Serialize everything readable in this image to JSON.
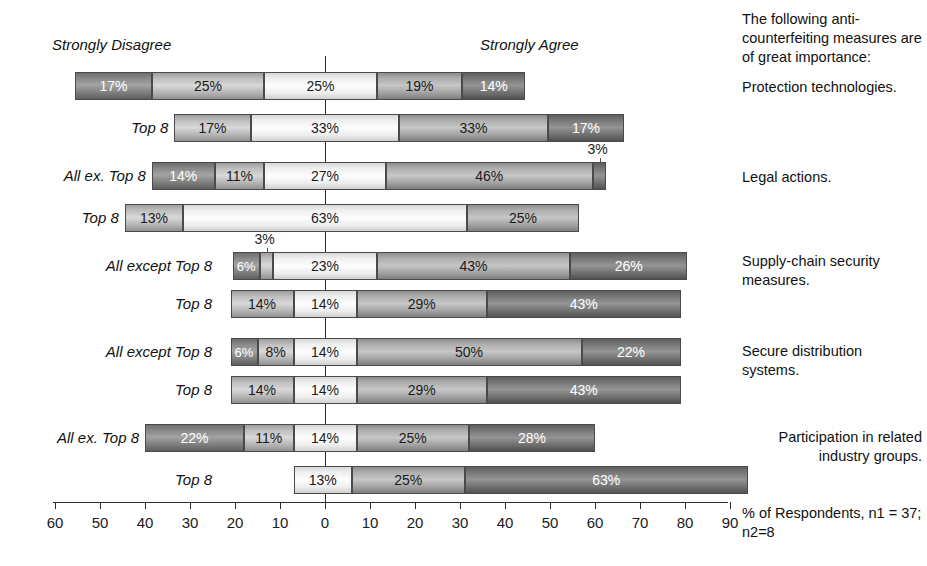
{
  "headers": {
    "left": "Strongly Disagree",
    "right": "Strongly Agree"
  },
  "legend_title": "The following anti-counterfeiting measures are of great importance:",
  "footnote": "% of Respondents, n1 = 37; n2=8",
  "categories": [
    "Protection technologies.",
    "Legal actions.",
    "Supply-chain security measures.",
    "Secure distribution systems.",
    "Participation in related industry groups."
  ],
  "row_labels": [
    "",
    "Top 8",
    "All ex. Top 8",
    "Top 8",
    "All except Top 8",
    "Top 8",
    "All except Top 8",
    "Top 8",
    "All ex. Top 8",
    "Top 8"
  ],
  "axis": {
    "ticks": [
      "60",
      "50",
      "40",
      "30",
      "20",
      "10",
      "0",
      "10",
      "20",
      "30",
      "40",
      "50",
      "60",
      "70",
      "80",
      "90"
    ],
    "min": -60,
    "max": 90,
    "zero": 0
  },
  "chart_data": {
    "type": "bar",
    "subtype": "diverging-stacked-bar",
    "title": "The following anti-counterfeiting measures are of great importance:",
    "xlabel": "% of Respondents, n1 = 37; n2=8",
    "ylabel": "",
    "xlim": [
      -60,
      90
    ],
    "grid": false,
    "legend_position": "none",
    "scale_endpoints": [
      "Strongly Disagree",
      "Strongly Agree"
    ],
    "annotations": [
      "Strongly Disagree",
      "Strongly Agree",
      "n1 = 37; n2=8"
    ],
    "categories": [
      "Protection technologies.",
      "Legal actions.",
      "Supply-chain security measures.",
      "Secure distribution systems.",
      "Participation in related industry groups."
    ],
    "rows": [
      {
        "category": "Protection technologies.",
        "group": "All",
        "label": "",
        "start": -55.5,
        "segments": [
          {
            "level": 1,
            "value": 17,
            "label": "17%"
          },
          {
            "level": 2,
            "value": 25,
            "label": "25%"
          },
          {
            "level": 3,
            "value": 25,
            "label": "25%"
          },
          {
            "level": 4,
            "value": 19,
            "label": "19%"
          },
          {
            "level": 5,
            "value": 14,
            "label": "14%"
          }
        ]
      },
      {
        "category": "Protection technologies.",
        "group": "Top 8",
        "label": "Top 8",
        "start": -33.5,
        "segments": [
          {
            "level": 2,
            "value": 17,
            "label": "17%"
          },
          {
            "level": 3,
            "value": 33,
            "label": "33%"
          },
          {
            "level": 4,
            "value": 33,
            "label": "33%"
          },
          {
            "level": 5,
            "value": 17,
            "label": "17%"
          }
        ]
      },
      {
        "category": "Legal actions.",
        "group": "All ex. Top 8",
        "label": "All ex. Top 8",
        "start": -38.5,
        "segments": [
          {
            "level": 1,
            "value": 14,
            "label": "14%"
          },
          {
            "level": 2,
            "value": 11,
            "label": "11%"
          },
          {
            "level": 3,
            "value": 27,
            "label": "27%"
          },
          {
            "level": 4,
            "value": 46,
            "label": "46%"
          },
          {
            "level": 5,
            "value": 3,
            "label": "3%",
            "callout": true
          }
        ]
      },
      {
        "category": "Legal actions.",
        "group": "Top 8",
        "label": "Top 8",
        "start": -44.5,
        "segments": [
          {
            "level": 2,
            "value": 13,
            "label": "13%"
          },
          {
            "level": 3,
            "value": 63,
            "label": "63%"
          },
          {
            "level": 4,
            "value": 25,
            "label": "25%"
          }
        ]
      },
      {
        "category": "Supply-chain security measures.",
        "group": "All except Top 8",
        "label": "All except Top 8",
        "start": -20.5,
        "segments": [
          {
            "level": 1,
            "value": 6,
            "label": "6%"
          },
          {
            "level": 2,
            "value": 3,
            "label": "3%",
            "callout": true
          },
          {
            "level": 3,
            "value": 23,
            "label": "23%"
          },
          {
            "level": 4,
            "value": 43,
            "label": "43%"
          },
          {
            "level": 5,
            "value": 26,
            "label": "26%"
          }
        ]
      },
      {
        "category": "Supply-chain security measures.",
        "group": "Top 8",
        "label": "Top 8",
        "start": -21.0,
        "segments": [
          {
            "level": 2,
            "value": 14,
            "label": "14%"
          },
          {
            "level": 3,
            "value": 14,
            "label": "14%"
          },
          {
            "level": 4,
            "value": 29,
            "label": "29%"
          },
          {
            "level": 5,
            "value": 43,
            "label": "43%"
          }
        ]
      },
      {
        "category": "Secure distribution systems.",
        "group": "All except Top 8",
        "label": "All except Top 8",
        "start": -21.0,
        "segments": [
          {
            "level": 1,
            "value": 6,
            "label": "6%"
          },
          {
            "level": 2,
            "value": 8,
            "label": "8%"
          },
          {
            "level": 3,
            "value": 14,
            "label": "14%"
          },
          {
            "level": 4,
            "value": 50,
            "label": "50%"
          },
          {
            "level": 5,
            "value": 22,
            "label": "22%"
          }
        ]
      },
      {
        "category": "Secure distribution systems.",
        "group": "Top 8",
        "label": "Top 8",
        "start": -21.0,
        "segments": [
          {
            "level": 2,
            "value": 14,
            "label": "14%"
          },
          {
            "level": 3,
            "value": 14,
            "label": "14%"
          },
          {
            "level": 4,
            "value": 29,
            "label": "29%"
          },
          {
            "level": 5,
            "value": 43,
            "label": "43%"
          }
        ]
      },
      {
        "category": "Participation in related industry groups.",
        "group": "All ex. Top 8",
        "label": "All ex. Top 8",
        "start": -40.0,
        "segments": [
          {
            "level": 1,
            "value": 22,
            "label": "22%"
          },
          {
            "level": 2,
            "value": 11,
            "label": "11%"
          },
          {
            "level": 3,
            "value": 14,
            "label": "14%"
          },
          {
            "level": 4,
            "value": 25,
            "label": "25%"
          },
          {
            "level": 5,
            "value": 28,
            "label": "28%"
          }
        ]
      },
      {
        "category": "Participation in related industry groups.",
        "group": "Top 8",
        "label": "Top 8",
        "start": -7.0,
        "segments": [
          {
            "level": 3,
            "value": 13,
            "label": "13%"
          },
          {
            "level": 4,
            "value": 25,
            "label": "25%"
          },
          {
            "level": 5,
            "value": 63,
            "label": "63%"
          }
        ]
      }
    ]
  },
  "layout": {
    "rows_y": [
      72,
      114,
      162,
      204,
      252,
      290,
      338,
      376,
      424,
      466
    ],
    "axis_y": 502,
    "px_per_unit": 4.5,
    "zero_x": 325,
    "axis_left_x": 53,
    "axis_right_x": 728,
    "row_label_right_x": 212,
    "category_label_y": [
      78,
      168,
      252,
      342,
      428
    ]
  }
}
